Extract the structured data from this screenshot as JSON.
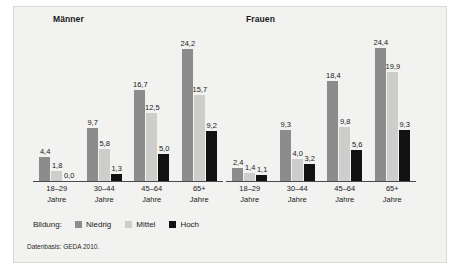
{
  "chart_data": {
    "type": "bar",
    "title": "",
    "xlabel": "",
    "ylabel": "",
    "ylim": [
      0,
      26
    ],
    "grid": false,
    "legend_position": "bottom-left",
    "legend_title": "Bildung:",
    "panels": [
      {
        "name": "maenner",
        "title": "Männer",
        "categories": [
          "18–29\nJahre",
          "30–44\nJahre",
          "45–64\nJahre",
          "65+\nJahre"
        ],
        "category_lines": [
          [
            "18–29",
            "Jahre"
          ],
          [
            "30–44",
            "Jahre"
          ],
          [
            "45–64",
            "Jahre"
          ],
          [
            "65+",
            "Jahre"
          ]
        ],
        "series": [
          {
            "name": "Niedrig",
            "values": [
              4.4,
              9.7,
              16.7,
              24.2
            ],
            "labels": [
              "4,4",
              "9,7",
              "16,7",
              "24,2"
            ]
          },
          {
            "name": "Mittel",
            "values": [
              1.8,
              5.8,
              12.5,
              15.7
            ],
            "labels": [
              "1,8",
              "5,8",
              "12,5",
              "15,7"
            ]
          },
          {
            "name": "Hoch",
            "values": [
              0.0,
              1.3,
              5.0,
              9.2
            ],
            "labels": [
              "0,0",
              "1,3",
              "5,0",
              "9,2"
            ]
          }
        ]
      },
      {
        "name": "frauen",
        "title": "Frauen",
        "categories": [
          "18–29\nJahre",
          "30–44\nJahre",
          "45–64\nJahre",
          "65+\nJahre"
        ],
        "category_lines": [
          [
            "18–29",
            "Jahre"
          ],
          [
            "30–44",
            "Jahre"
          ],
          [
            "45–64",
            "Jahre"
          ],
          [
            "65+",
            "Jahre"
          ]
        ],
        "series": [
          {
            "name": "Niedrig",
            "values": [
              2.4,
              9.3,
              18.4,
              24.4
            ],
            "labels": [
              "2,4",
              "9,3",
              "18,4",
              "24,4"
            ]
          },
          {
            "name": "Mittel",
            "values": [
              1.4,
              4.0,
              9.8,
              19.9
            ],
            "labels": [
              "1,4",
              "4,0",
              "9,8",
              "19,9"
            ]
          },
          {
            "name": "Hoch",
            "values": [
              1.1,
              3.2,
              5.6,
              9.3
            ],
            "labels": [
              "1,1",
              "3,2",
              "5,6",
              "9,3"
            ]
          }
        ]
      }
    ],
    "colors": {
      "niedrig": "#8c8c8c",
      "mittel": "#cdcdcb",
      "hoch": "#121212",
      "background": "#f2f2f0",
      "axis": "#4a4a4a",
      "text": "#1a1a1a"
    }
  },
  "legend": {
    "title": "Bildung:",
    "items": [
      {
        "label": "Niedrig",
        "color": "#8c8c8c"
      },
      {
        "label": "Mittel",
        "color": "#cdcdcb"
      },
      {
        "label": "Hoch",
        "color": "#121212"
      }
    ]
  },
  "source": {
    "note": "Datenbasis: GEDA 2010."
  }
}
